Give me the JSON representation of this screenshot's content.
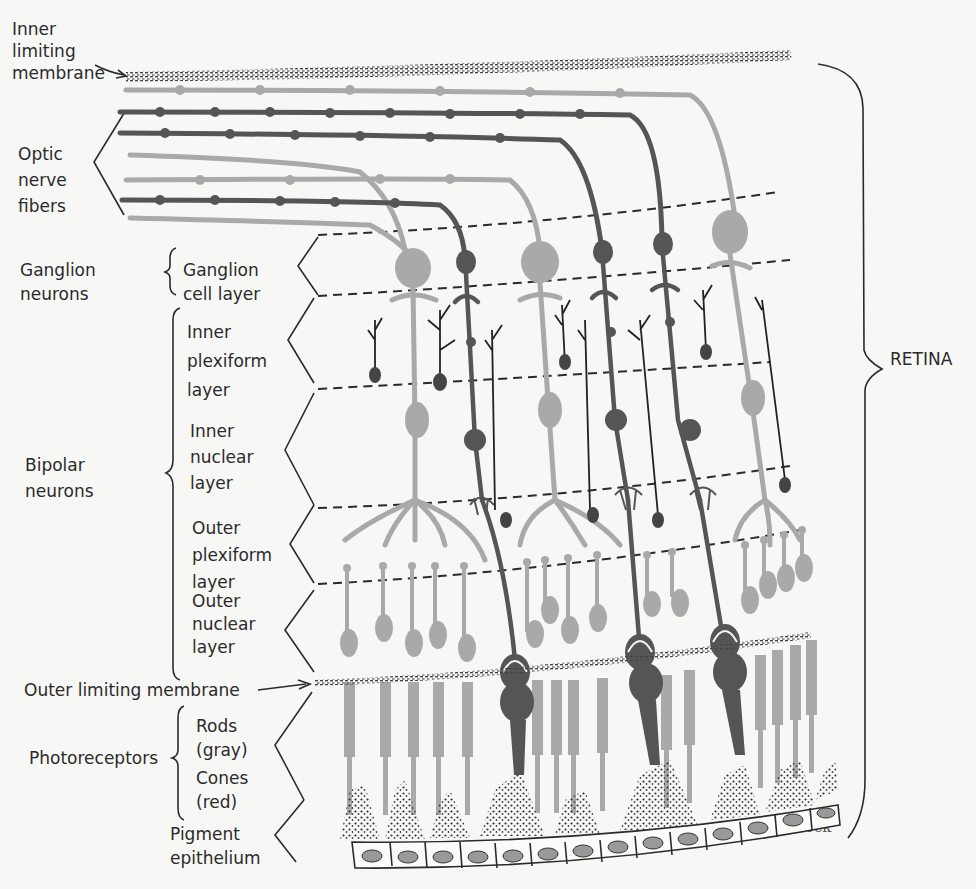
{
  "figure": {
    "title_label": "RETINA",
    "credit": "Beck",
    "colors": {
      "background": "#f7f7f5",
      "rod_gray": "#a9a9a9",
      "cone_dark": "#555555",
      "line": "#2b2b2b"
    }
  },
  "labels": {
    "inner_limiting_membrane": [
      "Inner",
      "limiting",
      "membrane"
    ],
    "optic_nerve_fibers": [
      "Optic",
      "nerve",
      "fibers"
    ],
    "ganglion_neurons": [
      "Ganglion",
      "neurons"
    ],
    "ganglion_cell_layer": [
      "Ganglion",
      "cell layer"
    ],
    "inner_plexiform_layer": [
      "Inner",
      "plexiform",
      "layer"
    ],
    "inner_nuclear_layer": [
      "Inner",
      "nuclear",
      "layer"
    ],
    "bipolar_neurons": [
      "Bipolar",
      "neurons"
    ],
    "outer_plexiform_layer": [
      "Outer",
      "plexiform",
      "layer"
    ],
    "outer_nuclear_layer": [
      "Outer",
      "nuclear",
      "layer"
    ],
    "outer_limiting_membrane": "Outer limiting membrane",
    "photoreceptors": "Photoreceptors",
    "rods": [
      "Rods",
      "(gray)"
    ],
    "cones": [
      "Cones",
      "(red)"
    ],
    "pigment_epithelium": [
      "Pigment",
      "epithelium"
    ]
  }
}
